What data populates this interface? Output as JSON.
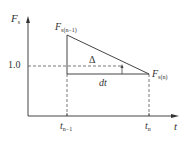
{
  "diagram": {
    "y_axis_label": "F",
    "y_axis_label_sub": "s",
    "x_axis_label": "t",
    "y_tick_label": "1.0",
    "point_top_label": "F",
    "point_top_sub": "s(n−1)",
    "point_right_label": "F",
    "point_right_sub": "s(n)",
    "delta_label": "Δ",
    "dt_label": "dt",
    "x_tick_left": "t",
    "x_tick_left_sub": "n−1",
    "x_tick_right": "t",
    "x_tick_right_sub": "n"
  },
  "colors": {
    "line": "#444444",
    "text": "#333333"
  }
}
